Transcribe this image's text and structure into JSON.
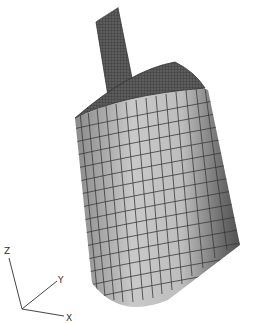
{
  "figure": {
    "colors": {
      "background": "#ffffff",
      "mesh_light": "#c4c4c4",
      "mesh_dark": "#5a5a5a",
      "grid_line": "#3a3a3a",
      "top_face": "#555555"
    }
  },
  "axes_triad": {
    "labels": {
      "z": "Z",
      "y": "Y",
      "x": "X"
    }
  }
}
